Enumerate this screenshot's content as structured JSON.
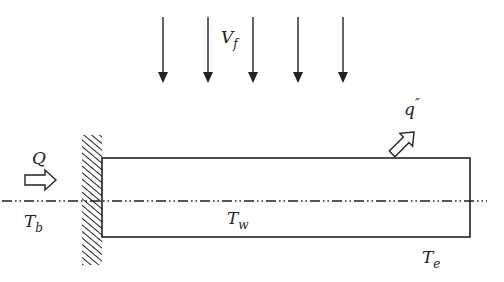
{
  "diagram": {
    "type": "fin-heat-transfer",
    "colors": {
      "stroke": "#222222",
      "background": "#ffffff"
    },
    "labels": {
      "velocity": {
        "main": "V",
        "sub": "f"
      },
      "heat_flux": {
        "main": "q",
        "sup": "″"
      },
      "heat_input": {
        "main": "Q"
      },
      "base_temp": {
        "main": "T",
        "sub": "b"
      },
      "wall_temp": {
        "main": "T",
        "sub": "w"
      },
      "end_temp": {
        "main": "T",
        "sub": "e"
      }
    },
    "flow_arrows": [
      {
        "x": 163
      },
      {
        "x": 208
      },
      {
        "x": 253
      },
      {
        "x": 298
      },
      {
        "x": 343
      }
    ],
    "fin": {
      "x1": 102,
      "y1": 158,
      "x2": 470,
      "y2": 237
    },
    "wall": {
      "x": 82,
      "y": 135,
      "width": 20,
      "height": 130
    },
    "centerline_y": 201
  }
}
